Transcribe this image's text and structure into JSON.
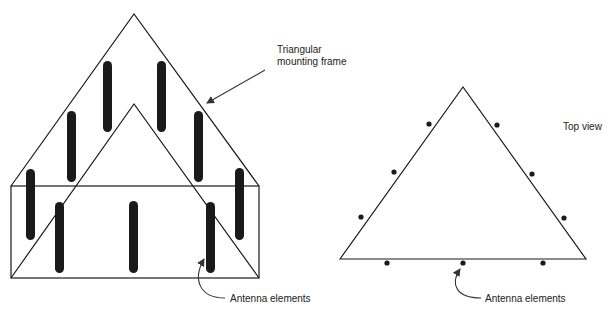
{
  "labels": {
    "frame": "Triangular\nmounting frame",
    "frame_line1": "Triangular",
    "frame_line2": "mounting frame",
    "top_view": "Top view",
    "antenna_left": "Antenna elements",
    "antenna_right": "Antenna elements"
  },
  "colors": {
    "line": "#1a1a1a",
    "rod": "#1a1a1a",
    "background": "#ffffff"
  },
  "perspective_view": {
    "outer_triangle": [
      [
        11,
        186
      ],
      [
        134,
        14
      ],
      [
        259,
        186
      ]
    ],
    "inner_triangle": [
      [
        11,
        278
      ],
      [
        134,
        104
      ],
      [
        259,
        278
      ]
    ],
    "box": {
      "x": 11,
      "y": 186,
      "width": 248,
      "height": 92
    },
    "rods": [
      {
        "x": 103,
        "top": 61,
        "bottom": 132
      },
      {
        "x": 157,
        "top": 61,
        "bottom": 132
      },
      {
        "x": 67,
        "top": 111,
        "bottom": 182
      },
      {
        "x": 194,
        "top": 111,
        "bottom": 182
      },
      {
        "x": 26,
        "top": 169,
        "bottom": 240
      },
      {
        "x": 235,
        "top": 168,
        "bottom": 240
      },
      {
        "x": 55,
        "top": 202,
        "bottom": 273
      },
      {
        "x": 129,
        "top": 201,
        "bottom": 273
      },
      {
        "x": 206,
        "top": 202,
        "bottom": 273
      }
    ]
  },
  "top_view": {
    "triangle": [
      [
        340,
        259
      ],
      [
        463,
        87
      ],
      [
        586,
        259
      ]
    ],
    "elements": [
      [
        429,
        124
      ],
      [
        394,
        172
      ],
      [
        361,
        217
      ],
      [
        497,
        125
      ],
      [
        532,
        174
      ],
      [
        564,
        218
      ],
      [
        387,
        263
      ],
      [
        463,
        263
      ],
      [
        543,
        263
      ]
    ]
  }
}
